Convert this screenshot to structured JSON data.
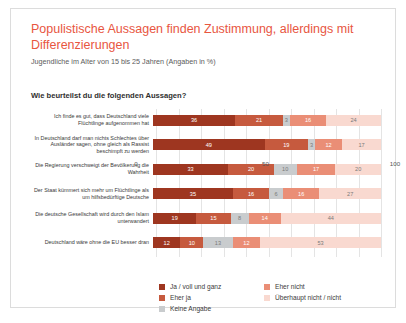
{
  "title": "Populistische Aussagen finden Zustimmung, allerdings mit Differenzierungen",
  "subtitle": "Jugendliche im Alter von 15 bis 25 Jahren (Angaben in %)",
  "question": "Wie beurteilst du die folgenden Aussagen?",
  "colors": {
    "accent": "#e8563f",
    "ja_voll_und_ganz": "#9e3620",
    "eher_ja": "#c65a3e",
    "keine_angabe": "#c9ccce",
    "eher_nicht": "#ea8e76",
    "ueberhaupt_nicht": "#f9d9d0",
    "gridline": "#e4e4e4",
    "card_border": "#dcdcdc"
  },
  "legend": {
    "column_1": [
      {
        "label": "Ja / voll und ganz",
        "color": "#9e3620"
      },
      {
        "label": "Eher ja",
        "color": "#c65a3e"
      },
      {
        "label": "Keine Angabe",
        "color": "#c9ccce"
      }
    ],
    "column_2": [
      {
        "label": "Eher nicht",
        "color": "#ea8e76"
      },
      {
        "label": "Überhaupt nicht / nicht",
        "color": "#f9d9d0"
      }
    ]
  },
  "chart_data": {
    "type": "bar",
    "title": "Populistische Aussagen finden Zustimmung, allerdings mit Differenzierungen",
    "subtitle": "Jugendliche im Alter von 15 bis 25 Jahren (Angaben in %)",
    "xlabel": "",
    "ylabel": "",
    "xlim": [
      0,
      100
    ],
    "ticks": [
      "0",
      "50",
      "100"
    ],
    "tick_values": [
      0,
      50,
      100
    ],
    "grid": true,
    "stacked": true,
    "orientation": "horizontal",
    "legend_position": "bottom",
    "categories": [
      "Ich finde es gut, dass Deutschland viele Flüchtlinge aufgenommen hat",
      "In Deutschland darf man nichts Schlechtes über Ausländer sagen, ohne gleich als Rassist beschimpft zu werden",
      "Die Regierung verschweigt der Bevölkerung die Wahrheit",
      "Der Staat kümmert sich mehr um Flüchtlinge als um hilfsbedürftige Deutsche",
      "Die deutsche Gesellschaft wird durch den Islam unterwandert",
      "Deutschland wäre ohne die EU besser dran"
    ],
    "series": [
      {
        "name": "Ja / voll und ganz",
        "color": "#9e3620",
        "values": [
          36,
          49,
          33,
          35,
          19,
          12
        ]
      },
      {
        "name": "Eher ja",
        "color": "#c65a3e",
        "values": [
          21,
          19,
          20,
          16,
          15,
          10
        ]
      },
      {
        "name": "Keine Angabe",
        "color": "#c9ccce",
        "values": [
          3,
          3,
          10,
          6,
          8,
          13
        ]
      },
      {
        "name": "Eher nicht",
        "color": "#ea8e76",
        "values": [
          16,
          12,
          17,
          16,
          14,
          12
        ]
      },
      {
        "name": "Überhaupt nicht / nicht",
        "color": "#f9d9d0",
        "values": [
          24,
          17,
          20,
          27,
          44,
          53
        ]
      }
    ]
  }
}
